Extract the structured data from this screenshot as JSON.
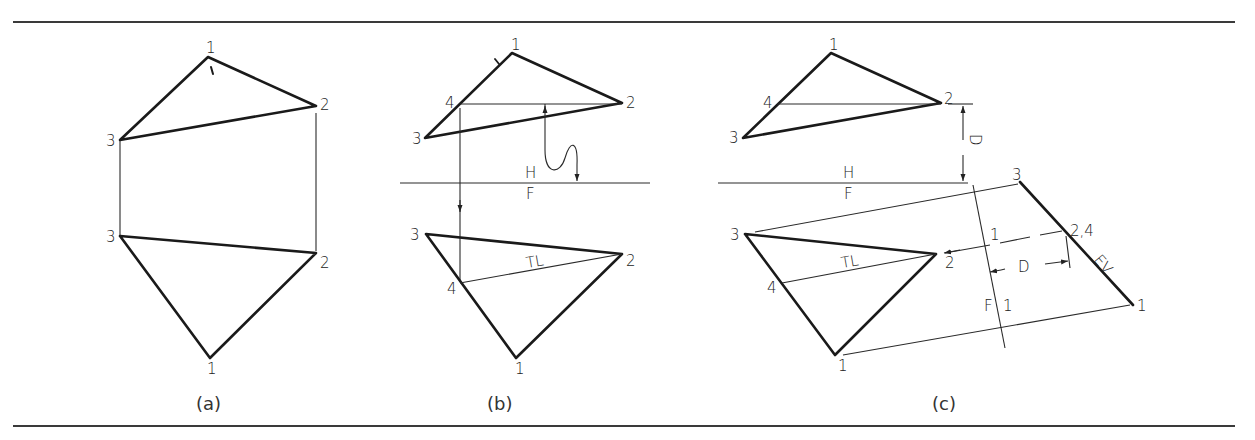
{
  "figure": {
    "panels": [
      {
        "caption": "(a)",
        "top_view": {
          "labels": {
            "p1": "1",
            "p2": "2",
            "p3": "3"
          }
        },
        "front_view": {
          "labels": {
            "p1": "1",
            "p2": "2",
            "p3": "3"
          }
        }
      },
      {
        "caption": "(b)",
        "top_view": {
          "labels": {
            "p1": "1",
            "p2": "2",
            "p3": "3",
            "p4": "4"
          }
        },
        "fold_line": {
          "upper": "H",
          "lower": "F"
        },
        "front_view": {
          "labels": {
            "p1": "1",
            "p2": "2",
            "p3": "3",
            "p4": "4"
          },
          "true_length": "TL"
        }
      },
      {
        "caption": "(c)",
        "top_view": {
          "labels": {
            "p1": "1",
            "p2": "2",
            "p3": "3",
            "p4": "4"
          }
        },
        "fold_line": {
          "upper": "H",
          "lower": "F"
        },
        "distance_label": "D",
        "front_view": {
          "labels": {
            "p1": "1",
            "p2": "2",
            "p3": "3",
            "p4": "4"
          },
          "true_length": "TL"
        },
        "aux_fold_line": {
          "left": "F",
          "right": "1",
          "top": "1"
        },
        "aux_view": {
          "labels": {
            "p1": "1",
            "p24": "2,4",
            "p3": "3"
          },
          "edge_view": "EV",
          "distance_label": "D"
        }
      }
    ]
  }
}
